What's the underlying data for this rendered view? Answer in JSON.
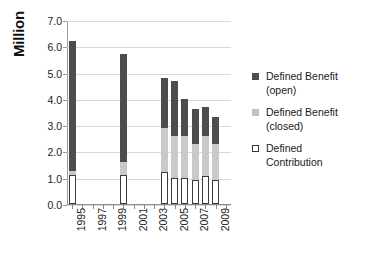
{
  "chart_data": {
    "type": "bar",
    "subtype": "stacked-vertical",
    "title": "",
    "xlabel": "",
    "ylabel": "Million",
    "ylim": [
      0.0,
      7.0
    ],
    "ytick_step": 1.0,
    "ytick_labels": [
      "7.0",
      "6.0",
      "5.0",
      "4.0",
      "3.0",
      "2.0",
      "1.0",
      "0.0"
    ],
    "ytick_values": [
      7.0,
      6.0,
      5.0,
      4.0,
      3.0,
      2.0,
      1.0,
      0.0
    ],
    "xlim": [
      1994.5,
      2010.5
    ],
    "x_all_ticks": [
      1995,
      1996,
      1997,
      1998,
      1999,
      2000,
      2001,
      2002,
      2003,
      2004,
      2005,
      2006,
      2007,
      2008,
      2009,
      2010
    ],
    "xtick_labels": [
      "1995",
      "1997",
      "1999",
      "2001",
      "2003",
      "2005",
      "2007",
      "2009"
    ],
    "xtick_label_values": [
      1995,
      1997,
      1999,
      2001,
      2003,
      2005,
      2007,
      2009
    ],
    "xtick_label_rotation": -90,
    "grid": "horizontal",
    "legend_position": "right",
    "categories": [
      1995,
      2000,
      2004,
      2005,
      2006,
      2007,
      2008,
      2009
    ],
    "series": [
      {
        "name": "Defined Contribution",
        "key": "defined_contribution",
        "color": "#ffffff",
        "edgecolor": "#3a3a3a",
        "values": [
          1.1,
          1.1,
          1.2,
          1.0,
          1.0,
          0.9,
          1.05,
          0.9
        ]
      },
      {
        "name": "Defined Benefit (closed)",
        "key": "defined_benefit_closed",
        "color": "#c9c9c9",
        "values": [
          0.15,
          0.5,
          1.7,
          1.6,
          1.6,
          1.4,
          1.55,
          1.4
        ]
      },
      {
        "name": "Defined Benefit (open)",
        "key": "defined_benefit_open",
        "color": "#4d4d4d",
        "values": [
          4.95,
          4.1,
          1.9,
          2.07,
          1.4,
          1.3,
          1.1,
          1.0
        ]
      }
    ],
    "totals": [
      6.2,
      5.7,
      4.8,
      4.67,
      4.0,
      3.6,
      3.7,
      3.3
    ]
  },
  "legend": {
    "entries": [
      {
        "label_line1": "Defined Benefit",
        "label_line2": "(open)",
        "swatch": "dark-gray-square"
      },
      {
        "label_line1": "Defined Benefit",
        "label_line2": "(closed)",
        "swatch": "light-gray-square"
      },
      {
        "label_line1": "Defined",
        "label_line2": "Contribution",
        "swatch": "white-outlined-square"
      }
    ]
  },
  "axis": {
    "y_title": "Million"
  },
  "colors": {
    "defined_benefit_open": "#4d4d4d",
    "defined_benefit_closed": "#c9c9c9",
    "defined_contribution": "#ffffff",
    "gridline": "#d9d9d9",
    "axis": "#8a8a8a",
    "text": "#1a1a1a",
    "background": "#ffffff"
  }
}
